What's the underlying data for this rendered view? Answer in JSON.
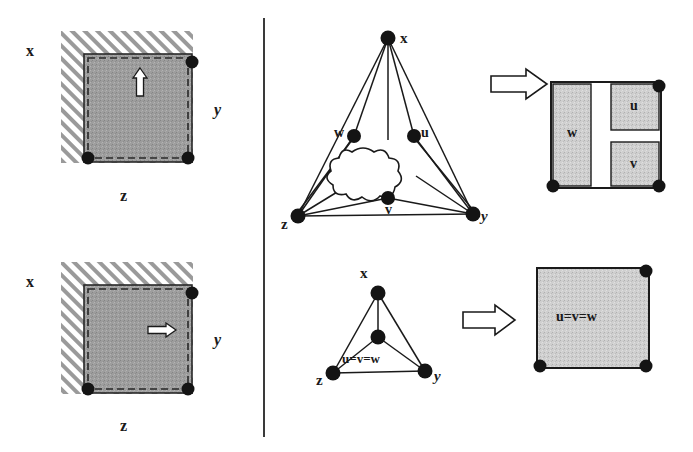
{
  "figure": {
    "divider": {
      "name": "vertical-divider",
      "x": 264,
      "y1": 18,
      "y2": 437
    },
    "colors": {
      "ink": "#1a1a1a",
      "hatch": "#9a9a9a",
      "gray_fill": "#9d9d9d",
      "light_gray_fill": "#c9c9c9",
      "white": "#ffffff",
      "page_bg": "#ffffff"
    },
    "panels": [
      {
        "id": "top-left",
        "name": "panel-square-vertical-growth",
        "labels": [
          {
            "name": "label-x",
            "text": "x",
            "x": 29,
            "y": 44
          },
          {
            "name": "label-y",
            "text": "y",
            "x": 217,
            "y": 105
          },
          {
            "name": "label-z",
            "text": "z",
            "x": 122,
            "y": 198
          }
        ],
        "arrow": {
          "name": "arrow-up-glyph",
          "direction": "up",
          "x": 140,
          "y": 72
        },
        "corner_dots": [
          "top-right",
          "bottom-left",
          "bottom-right"
        ]
      },
      {
        "id": "bottom-left",
        "name": "panel-square-horizontal-growth",
        "labels": [
          {
            "name": "label-x",
            "text": "x",
            "x": 29,
            "y": 275
          },
          {
            "name": "label-y",
            "text": "y",
            "x": 217,
            "y": 335
          },
          {
            "name": "label-z",
            "text": "z",
            "x": 122,
            "y": 428
          }
        ],
        "arrow": {
          "name": "arrow-right-glyph",
          "direction": "right",
          "x": 158,
          "y": 324
        },
        "corner_dots": [
          "top-right",
          "bottom-left",
          "bottom-right"
        ]
      },
      {
        "id": "top-right-graph",
        "name": "panel-graph-expanded",
        "labels": [
          {
            "name": "node-label-x",
            "text": "x",
            "x": 400,
            "y": 32
          },
          {
            "name": "node-label-w",
            "text": "w",
            "x": 337,
            "y": 127
          },
          {
            "name": "node-label-u",
            "text": "u",
            "x": 424,
            "y": 127
          },
          {
            "name": "node-label-v",
            "text": "v",
            "x": 389,
            "y": 206
          },
          {
            "name": "node-label-z",
            "text": "z",
            "x": 284,
            "y": 219
          },
          {
            "name": "node-label-y",
            "text": "y",
            "x": 480,
            "y": 214
          }
        ],
        "nodes": [
          "x",
          "w",
          "u",
          "v",
          "z",
          "y"
        ],
        "cloud": {
          "name": "cloud-blob",
          "note": "unspecified subgraph"
        }
      },
      {
        "id": "top-right-rect",
        "name": "panel-dissection-expanded",
        "labels": [
          {
            "name": "region-label-w",
            "text": "w",
            "x": 572,
            "y": 128
          },
          {
            "name": "region-label-u",
            "text": "u",
            "x": 632,
            "y": 108
          },
          {
            "name": "region-label-v",
            "text": "v",
            "x": 632,
            "y": 168
          }
        ],
        "corner_dots": [
          "top-right",
          "bottom-left",
          "bottom-right"
        ]
      },
      {
        "id": "bottom-right-graph",
        "name": "panel-graph-collapsed",
        "labels": [
          {
            "name": "node-label-x",
            "text": "x",
            "x": 362,
            "y": 273
          },
          {
            "name": "node-label-merged",
            "text": "u=v=w",
            "x": 353,
            "y": 360
          },
          {
            "name": "node-label-z",
            "text": "z",
            "x": 320,
            "y": 377
          },
          {
            "name": "node-label-y",
            "text": "y",
            "x": 435,
            "y": 375
          }
        ],
        "nodes": [
          "x",
          "u=v=w",
          "z",
          "y"
        ]
      },
      {
        "id": "bottom-right-rect",
        "name": "panel-dissection-collapsed",
        "labels": [
          {
            "name": "region-label-merged",
            "text": "u=v=w",
            "x": 561,
            "y": 319
          }
        ],
        "corner_dots": [
          "top-right",
          "bottom-left",
          "bottom-right"
        ]
      }
    ],
    "transform_arrows": [
      {
        "name": "transform-arrow-top",
        "x": 497,
        "y": 85
      },
      {
        "name": "transform-arrow-bottom",
        "x": 470,
        "y": 320
      }
    ]
  }
}
